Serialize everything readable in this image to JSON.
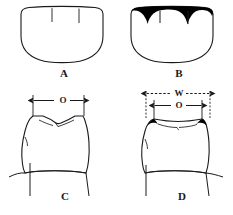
{
  "figure": {
    "type": "line-drawing",
    "background_color": "#ffffff",
    "stroke_color": "#1a1a1a",
    "fill_color": "#000000"
  },
  "panels": [
    {
      "id": "A",
      "label": "A",
      "view": "occlusal",
      "description": "unworn tooth crown outline with two developmental grooves",
      "shaded": false
    },
    {
      "id": "B",
      "label": "B",
      "view": "occlusal",
      "description": "tooth crown outline with black filled wear facets along the occlusal margin",
      "shaded": true
    },
    {
      "id": "C",
      "label": "C",
      "view": "buccal",
      "description": "unworn tooth crown with pointed cusps and cervical line",
      "shaded": false
    },
    {
      "id": "D",
      "label": "D",
      "view": "buccal",
      "description": "worn tooth crown with flattened occlusal surface and black wear facets at the corners",
      "shaded": true
    }
  ],
  "dimensions": [
    {
      "id": "o-c",
      "label": "O",
      "panel": "C",
      "style": "solid",
      "arrows": "both",
      "meaning": "occlusal width"
    },
    {
      "id": "w-d",
      "label": "W",
      "panel": "D",
      "style": "dashed",
      "arrows": "both",
      "meaning": "maximum crown width"
    },
    {
      "id": "o-d",
      "label": "O",
      "panel": "D",
      "style": "solid",
      "arrows": "both",
      "meaning": "occlusal width"
    }
  ]
}
